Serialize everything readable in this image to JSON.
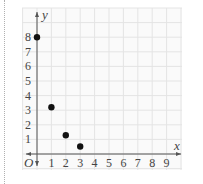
{
  "chart_data": {
    "type": "scatter",
    "title": "",
    "xlabel": "x",
    "ylabel": "y",
    "origin_label": "O",
    "xlim": [
      0,
      9
    ],
    "ylim": [
      0,
      8
    ],
    "grid": true,
    "x_ticks": [
      "1",
      "2",
      "3",
      "4",
      "5",
      "6",
      "7",
      "8",
      "9"
    ],
    "y_ticks": [
      "1",
      "2",
      "3",
      "4",
      "5",
      "6",
      "7",
      "8"
    ],
    "series": [
      {
        "name": "points",
        "x": [
          0,
          1,
          2,
          3
        ],
        "y": [
          8,
          3.2,
          1.28,
          0.512
        ]
      }
    ],
    "colors": {
      "grid": "#e4e4e4",
      "axis": "#555555",
      "point": "#111111",
      "panel": "#fafafa"
    }
  }
}
